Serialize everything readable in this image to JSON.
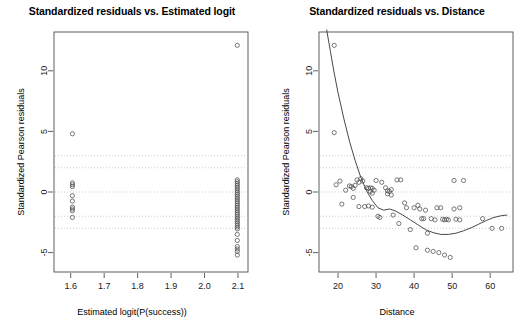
{
  "figure": {
    "background": "#ffffff",
    "axis_color": "#4d4d4d",
    "point_color": "#4d4d4d",
    "curve_color": "#333333",
    "refline_color": "#bfbfbf"
  },
  "chart_data": [
    {
      "type": "scatter",
      "panel": "left",
      "title": "Standardized residuals vs. Estimated logit",
      "xlabel": "Estimated logit(P(success))",
      "ylabel": "Standardized Pearson residuals",
      "xlim": [
        1.55,
        2.13
      ],
      "ylim": [
        -6.6,
        13.2
      ],
      "xticks": [
        "1.6",
        "1.7",
        "1.8",
        "1.9",
        "2.0",
        "2.1"
      ],
      "xtickvalues": [
        1.6,
        1.7,
        1.8,
        1.9,
        2.0,
        2.1
      ],
      "yticks": [
        "-5",
        "0",
        "5",
        "10"
      ],
      "ytickvalues": [
        -5,
        0,
        5,
        10
      ],
      "grid": false,
      "reference_lines": [
        3,
        2,
        0,
        -2,
        -3
      ],
      "reference_line_style": "dotted",
      "points": [
        [
          1.605,
          4.8
        ],
        [
          2.098,
          12.1
        ],
        [
          1.605,
          0.75
        ],
        [
          1.605,
          0.6
        ],
        [
          1.605,
          0.45
        ],
        [
          1.605,
          -0.3
        ],
        [
          1.605,
          -0.75
        ],
        [
          1.605,
          -1.25
        ],
        [
          1.605,
          -1.4
        ],
        [
          1.605,
          -1.55
        ],
        [
          1.605,
          -2.1
        ],
        [
          2.098,
          1.0
        ],
        [
          2.098,
          0.85
        ],
        [
          2.098,
          0.7
        ],
        [
          2.098,
          0.55
        ],
        [
          2.098,
          0.4
        ],
        [
          2.098,
          0.25
        ],
        [
          2.098,
          0.1
        ],
        [
          2.098,
          -0.05
        ],
        [
          2.098,
          -0.2
        ],
        [
          2.098,
          -0.35
        ],
        [
          2.098,
          -0.5
        ],
        [
          2.098,
          -0.65
        ],
        [
          2.098,
          -0.8
        ],
        [
          2.098,
          -0.95
        ],
        [
          2.098,
          -1.1
        ],
        [
          2.098,
          -1.25
        ],
        [
          2.098,
          -1.4
        ],
        [
          2.098,
          -1.55
        ],
        [
          2.098,
          -1.7
        ],
        [
          2.098,
          -1.85
        ],
        [
          2.098,
          -2.0
        ],
        [
          2.098,
          -2.15
        ],
        [
          2.098,
          -2.3
        ],
        [
          2.098,
          -2.45
        ],
        [
          2.098,
          -2.6
        ],
        [
          2.098,
          -2.75
        ],
        [
          2.098,
          -2.9
        ],
        [
          2.098,
          -3.05
        ],
        [
          2.098,
          -3.5
        ],
        [
          2.098,
          -4.0
        ],
        [
          2.098,
          -4.5
        ],
        [
          2.098,
          -4.7
        ],
        [
          2.098,
          -4.9
        ],
        [
          2.098,
          -5.2
        ]
      ]
    },
    {
      "type": "scatter",
      "panel": "right",
      "title": "Standardized residuals vs. Distance",
      "xlabel": "Distance",
      "ylabel": "Standardized Pearson residuals",
      "xlim": [
        15.0,
        66.0
      ],
      "ylim": [
        -6.6,
        13.2
      ],
      "xticks": [
        "20",
        "30",
        "40",
        "50",
        "60"
      ],
      "xtickvalues": [
        20,
        30,
        40,
        50,
        60
      ],
      "yticks": [
        "-5",
        "0",
        "5",
        "10"
      ],
      "ytickvalues": [
        -5,
        0,
        5,
        10
      ],
      "grid": false,
      "reference_lines": [
        3,
        2,
        0,
        -2,
        -3
      ],
      "reference_line_style": "dotted",
      "smoother": {
        "label": "lowess smoother",
        "x": [
          17.0,
          18.0,
          19.0,
          20.0,
          21.5,
          23.0,
          24.5,
          26.0,
          27.5,
          29.0,
          30.5,
          32.0,
          33.5,
          35.0,
          37.0,
          39.0,
          41.0,
          43.0,
          45.0,
          47.0,
          49.0,
          51.0,
          53.0,
          55.0,
          57.0,
          59.0,
          61.0,
          63.0,
          64.5
        ],
        "y": [
          13.4,
          11.6,
          9.8,
          8.2,
          6.1,
          4.2,
          2.6,
          1.2,
          0.1,
          -0.7,
          -1.3,
          -1.5,
          -1.4,
          -1.55,
          -1.9,
          -2.3,
          -2.7,
          -3.1,
          -3.35,
          -3.5,
          -3.5,
          -3.4,
          -3.2,
          -2.95,
          -2.65,
          -2.35,
          -2.1,
          -1.95,
          -1.9
        ]
      },
      "points": [
        [
          19.0,
          12.1
        ],
        [
          19.0,
          4.9
        ],
        [
          19.5,
          0.6
        ],
        [
          20.5,
          0.9
        ],
        [
          21.0,
          -1.0
        ],
        [
          22.0,
          0.15
        ],
        [
          23.0,
          0.5
        ],
        [
          23.5,
          0.45
        ],
        [
          24.0,
          0.3
        ],
        [
          24.5,
          0.55
        ],
        [
          25.0,
          1.0
        ],
        [
          25.5,
          0.8
        ],
        [
          26.0,
          1.1
        ],
        [
          26.5,
          0.9
        ],
        [
          24.0,
          -0.45
        ],
        [
          25.5,
          -1.2
        ],
        [
          27.0,
          -1.2
        ],
        [
          27.5,
          0.35
        ],
        [
          28.0,
          0.3
        ],
        [
          28.5,
          0.35
        ],
        [
          29.0,
          0.3
        ],
        [
          28.5,
          0.05
        ],
        [
          29.0,
          -0.1
        ],
        [
          29.5,
          0.15
        ],
        [
          28.0,
          -1.15
        ],
        [
          29.0,
          -1.25
        ],
        [
          30.0,
          0.95
        ],
        [
          31.5,
          0.8
        ],
        [
          30.5,
          -2.0
        ],
        [
          31.0,
          -2.1
        ],
        [
          32.5,
          0.35
        ],
        [
          33.0,
          0.1
        ],
        [
          33.5,
          0.05
        ],
        [
          34.0,
          0.2
        ],
        [
          33.0,
          -0.15
        ],
        [
          34.0,
          -0.25
        ],
        [
          35.5,
          1.0
        ],
        [
          36.5,
          1.0
        ],
        [
          34.5,
          -1.9
        ],
        [
          36.0,
          -2.6
        ],
        [
          37.5,
          -0.9
        ],
        [
          38.0,
          -1.3
        ],
        [
          39.0,
          -3.1
        ],
        [
          40.0,
          -1.3
        ],
        [
          41.0,
          -1.1
        ],
        [
          41.5,
          -1.4
        ],
        [
          40.5,
          -4.6
        ],
        [
          42.0,
          -2.2
        ],
        [
          42.5,
          -2.2
        ],
        [
          43.0,
          -1.5
        ],
        [
          43.5,
          -3.4
        ],
        [
          44.5,
          -2.2
        ],
        [
          45.5,
          -2.3
        ],
        [
          43.5,
          -4.8
        ],
        [
          45.0,
          -4.9
        ],
        [
          46.5,
          -5.0
        ],
        [
          46.0,
          -1.3
        ],
        [
          47.0,
          -1.3
        ],
        [
          47.5,
          -2.25
        ],
        [
          48.0,
          -2.3
        ],
        [
          48.5,
          -2.25
        ],
        [
          49.0,
          -2.3
        ],
        [
          48.0,
          -5.2
        ],
        [
          49.5,
          -5.4
        ],
        [
          50.5,
          0.95
        ],
        [
          53.0,
          0.95
        ],
        [
          50.5,
          -1.4
        ],
        [
          52.0,
          -1.3
        ],
        [
          51.0,
          -2.25
        ],
        [
          52.0,
          -2.3
        ],
        [
          58.0,
          -2.2
        ],
        [
          60.5,
          -3.0
        ],
        [
          63.0,
          -3.0
        ]
      ]
    }
  ]
}
